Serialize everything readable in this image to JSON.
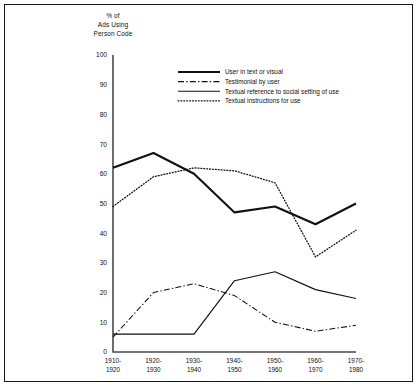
{
  "chart_data": {
    "type": "line",
    "title": "",
    "ylabel": "% of\nAds Using\nPerson Code",
    "ylabel_lines": [
      "% of",
      "Ads Using",
      "Person Code"
    ],
    "xlabel": "",
    "categories": [
      "1910-1920",
      "1920-1930",
      "1930-1940",
      "1940-1950",
      "1950-1960",
      "1960-1970",
      "1970-1980"
    ],
    "category_lines": [
      [
        "1910-",
        "1920"
      ],
      [
        "1920-",
        "1930"
      ],
      [
        "1930-",
        "1940"
      ],
      [
        "1940-",
        "1950"
      ],
      [
        "1950-",
        "1960"
      ],
      [
        "1960-",
        "1970"
      ],
      [
        "1970-",
        "1980"
      ]
    ],
    "ylim": [
      0,
      100
    ],
    "yticks": [
      0,
      10,
      20,
      30,
      40,
      50,
      60,
      70,
      80,
      90,
      100
    ],
    "grid": false,
    "legend_position": "top-center",
    "series": [
      {
        "name": "User in text or visual",
        "style": "thick-solid",
        "values": [
          62,
          67,
          60,
          47,
          49,
          43,
          50
        ]
      },
      {
        "name": "Testimonial by user",
        "style": "dash-dot",
        "values": [
          5,
          20,
          23,
          19,
          10,
          7,
          9
        ]
      },
      {
        "name": "Textual reference to social setting of use",
        "style": "thin-solid",
        "values": [
          6,
          6,
          6,
          24,
          27,
          21,
          18
        ]
      },
      {
        "name": "Textual instructions for use",
        "style": "dotted",
        "values": [
          49,
          59,
          62,
          61,
          57,
          32,
          41
        ]
      }
    ]
  },
  "colors": {
    "ink": "#111111",
    "axis": "#4a4a4a",
    "frame": "#1a1a1a",
    "background": "#ffffff"
  }
}
